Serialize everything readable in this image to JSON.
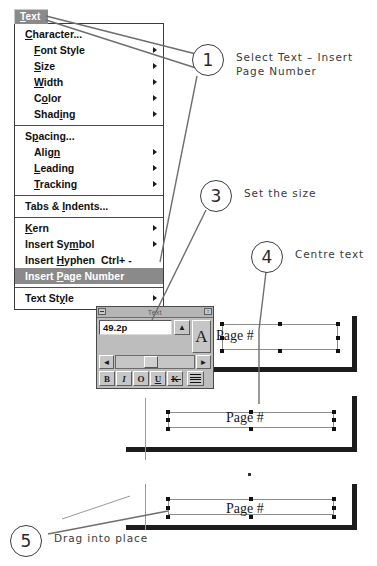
{
  "menu": {
    "title": "Text",
    "title_accel": "T",
    "groups": [
      {
        "items": [
          {
            "label": "Character...",
            "accel_index": 0,
            "submenu": false,
            "selected": false,
            "indent": false
          },
          {
            "label": "Font Style",
            "accel_index": 0,
            "submenu": true,
            "selected": false,
            "indent": true
          },
          {
            "label": "Size",
            "accel_index": 0,
            "submenu": true,
            "selected": false,
            "indent": true
          },
          {
            "label": "Width",
            "accel_index": 0,
            "submenu": true,
            "selected": false,
            "indent": true
          },
          {
            "label": "Color",
            "accel_index": 1,
            "submenu": true,
            "selected": false,
            "indent": true
          },
          {
            "label": "Shading",
            "accel_index": 4,
            "submenu": true,
            "selected": false,
            "indent": true
          }
        ]
      },
      {
        "items": [
          {
            "label": "Spacing...",
            "accel_index": 1,
            "submenu": false,
            "selected": false,
            "indent": false
          },
          {
            "label": "Align",
            "accel_index": 4,
            "submenu": true,
            "selected": false,
            "indent": true
          },
          {
            "label": "Leading",
            "accel_index": 0,
            "submenu": true,
            "selected": false,
            "indent": true
          },
          {
            "label": "Tracking",
            "accel_index": 0,
            "submenu": true,
            "selected": false,
            "indent": true
          }
        ]
      },
      {
        "items": [
          {
            "label": "Tabs & Indents...",
            "accel_index": 7,
            "submenu": false,
            "selected": false,
            "indent": false
          }
        ]
      },
      {
        "items": [
          {
            "label": "Kern",
            "accel_index": 0,
            "submenu": true,
            "selected": false,
            "indent": false
          },
          {
            "label": "Insert Symbol",
            "accel_index": 9,
            "submenu": true,
            "selected": false,
            "indent": false
          },
          {
            "label": "Insert Hyphen",
            "accel_index": 7,
            "submenu": false,
            "selected": false,
            "indent": false,
            "shortcut": "Ctrl+ -"
          },
          {
            "label": "Insert Page Number",
            "accel_index": 7,
            "submenu": false,
            "selected": true,
            "indent": false
          }
        ]
      },
      {
        "items": [
          {
            "label": "Text Style",
            "accel_index": 7,
            "submenu": true,
            "selected": false,
            "indent": false
          }
        ]
      }
    ]
  },
  "callouts": [
    {
      "number": "1",
      "text": "Select Text – Insert\nPage Number"
    },
    {
      "number": "3",
      "text": "Set the size"
    },
    {
      "number": "4",
      "text": "Centre text"
    },
    {
      "number": "5",
      "text": "Drag into place"
    }
  ],
  "palette": {
    "title": "Text",
    "close_icon": "close-box-icon",
    "resize_icon": "resize-box-icon",
    "size_value": "49.2p",
    "spin_up_label": "▲",
    "spin_down_label": "▼",
    "big_a_label": "A",
    "slider_left_label": "◄",
    "slider_right_label": "►",
    "format_buttons": [
      {
        "name": "bold",
        "label": "B"
      },
      {
        "name": "italic",
        "label": "I"
      },
      {
        "name": "outline",
        "label": "O"
      },
      {
        "name": "underline",
        "label": "U"
      },
      {
        "name": "strikethrough",
        "label": "K"
      }
    ],
    "align_icon": "align-center-icon"
  },
  "pages": [
    {
      "id": "page-top",
      "text": "Page #"
    },
    {
      "id": "page-middle",
      "text": "Page #"
    },
    {
      "id": "page-bottom",
      "text": "Page #"
    }
  ]
}
